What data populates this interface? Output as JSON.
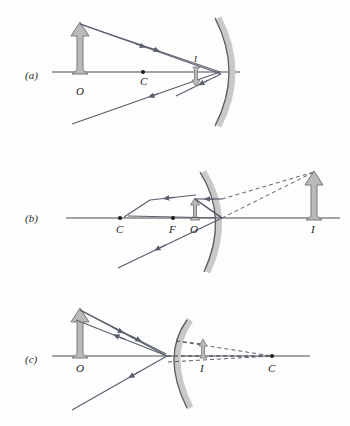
{
  "figure": {
    "title": "",
    "background_color": "#fdfdfd",
    "ray_color": "#5a5f6e",
    "mirror_line_color": "#4a4a4a",
    "mirror_band_color": "#c9c9c9",
    "axis_color": "#4a4a4a",
    "arrow_fill_color": "#b9b9b9",
    "arrow_stroke_color": "#7a7a7a",
    "dashed_color": "#5a5f6e"
  },
  "panels": [
    {
      "id": "a",
      "label": "(a)",
      "mirror_type": "concave",
      "image_type": "real-inverted",
      "points": [
        {
          "name": "O",
          "label": "O",
          "x": 80,
          "y": 84,
          "dot": false
        },
        {
          "name": "C",
          "label": "C",
          "x": 143,
          "y": 84,
          "dot": true
        },
        {
          "name": "I",
          "label": "I",
          "x": 196,
          "y": 62,
          "dot": false
        }
      ],
      "object": {
        "label": "",
        "base_x": 80,
        "base_y": 72,
        "height": 40,
        "direction": "up"
      },
      "image": {
        "label": "I",
        "base_x": 196,
        "base_y": 72,
        "height": 14,
        "direction": "down"
      }
    },
    {
      "id": "b",
      "label": "(b)",
      "mirror_type": "concave",
      "image_type": "virtual-upright-magnified",
      "points": [
        {
          "name": "C",
          "label": "C",
          "x": 120,
          "y": 230,
          "dot": true
        },
        {
          "name": "F",
          "label": "F",
          "x": 173,
          "y": 230,
          "dot": true
        },
        {
          "name": "O",
          "label": "O",
          "x": 195,
          "y": 230,
          "dot": false
        },
        {
          "name": "I",
          "label": "I",
          "x": 314,
          "y": 230,
          "dot": false
        }
      ],
      "object": {
        "label": "",
        "base_x": 195,
        "base_y": 218,
        "height": 18,
        "direction": "up"
      },
      "image": {
        "label": "I",
        "base_x": 314,
        "base_y": 218,
        "height": 48,
        "direction": "up"
      }
    },
    {
      "id": "c",
      "label": "(c)",
      "mirror_type": "convex",
      "image_type": "virtual-upright-reduced",
      "points": [
        {
          "name": "O",
          "label": "O",
          "x": 80,
          "y": 368,
          "dot": false
        },
        {
          "name": "I",
          "label": "I",
          "x": 203,
          "y": 368,
          "dot": false
        },
        {
          "name": "C",
          "label": "C",
          "x": 272,
          "y": 368,
          "dot": true
        }
      ],
      "object": {
        "label": "",
        "base_x": 80,
        "base_y": 356,
        "height": 40,
        "direction": "up"
      },
      "image": {
        "label": "I",
        "base_x": 203,
        "base_y": 356,
        "height": 16,
        "direction": "up"
      }
    }
  ],
  "annotations": {
    "ray_arrow_marker": "arrowhead",
    "dot_marker": "filled-circle",
    "dashed_pattern": "4,3"
  }
}
